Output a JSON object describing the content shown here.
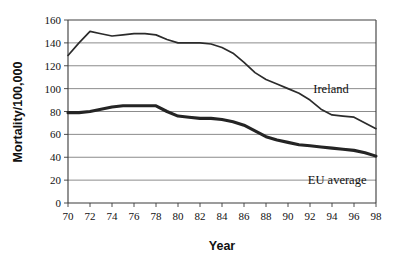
{
  "chart_data": {
    "type": "line",
    "title": "",
    "xlabel": "Year",
    "ylabel": "Mortality/100,000",
    "xlim": [
      70,
      98
    ],
    "ylim": [
      0,
      160
    ],
    "grid": true,
    "legend_position": "inline-right",
    "x": [
      70,
      71,
      72,
      73,
      74,
      75,
      76,
      77,
      78,
      79,
      80,
      81,
      82,
      83,
      84,
      85,
      86,
      87,
      88,
      89,
      90,
      91,
      92,
      93,
      94,
      95,
      96,
      97,
      98
    ],
    "xticks": [
      70,
      72,
      74,
      76,
      78,
      80,
      82,
      84,
      86,
      88,
      90,
      92,
      94,
      96,
      98
    ],
    "yticks": [
      0,
      20,
      40,
      60,
      80,
      100,
      120,
      140,
      160
    ],
    "series": [
      {
        "name": "Ireland",
        "label_value": "Ireland",
        "values": [
          129,
          140,
          150,
          148,
          146,
          147,
          148,
          148,
          147,
          143,
          140,
          140,
          140,
          139,
          136,
          131,
          123,
          114,
          108,
          104,
          100,
          96,
          90,
          82,
          77,
          76,
          75,
          70,
          65
        ]
      },
      {
        "name": "EU average",
        "label_value": "EU average",
        "values": [
          79,
          79,
          80,
          82,
          84,
          85,
          85,
          85,
          85,
          80,
          76,
          75,
          74,
          74,
          73,
          71,
          68,
          63,
          58,
          55,
          53,
          51,
          50,
          49,
          48,
          47,
          46,
          44,
          41
        ]
      }
    ],
    "annotations": [
      {
        "text": "Ireland",
        "x": 92.3,
        "y": 100
      },
      {
        "text": "EU average",
        "x": 91.8,
        "y": 20
      }
    ],
    "colors": {
      "ireland_line": "#2b2b2b",
      "eu_line": "#242424",
      "gridline": "#5a5a5a",
      "frame": "#3a3a3a",
      "background": "#ffffff",
      "text": "#111111"
    }
  }
}
